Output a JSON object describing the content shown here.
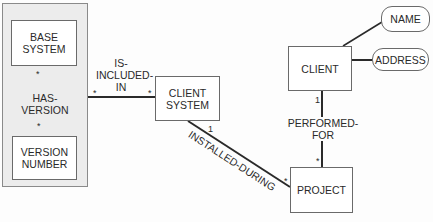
{
  "diagram": {
    "type": "entity-relationship / object model",
    "group": {
      "name": "base-system-group"
    },
    "entities": {
      "base_system": "BASE\nSYSTEM",
      "version_number": "VERSION\nNUMBER",
      "client_system": "CLIENT\nSYSTEM",
      "client": "CLIENT",
      "project": "PROJECT"
    },
    "attributes": {
      "name": "NAME",
      "address": "ADDRESS"
    },
    "relationships": {
      "has_version": {
        "label": "HAS-VERSION",
        "from": "BASE SYSTEM",
        "from_mult": "*",
        "to": "VERSION NUMBER",
        "to_mult": "*"
      },
      "is_included_in": {
        "label": "IS-\nINCLUDED-\nIN",
        "from": "BASE SYSTEM/VERSION NUMBER group",
        "from_mult": "*",
        "to": "CLIENT SYSTEM",
        "to_mult": "*"
      },
      "installed_during": {
        "label": "INSTALLED-DURING",
        "from": "CLIENT SYSTEM",
        "from_mult": "1",
        "to": "PROJECT",
        "to_mult": "*"
      },
      "performed_for": {
        "label": "PERFORMED-FOR",
        "from": "CLIENT",
        "from_mult": "1",
        "to": "PROJECT",
        "to_mult": "*"
      }
    },
    "colors": {
      "background": "#fdfdfd",
      "group_fill": "#ececec",
      "line": "#2a2a2a",
      "box_border": "#6a6a6a"
    }
  }
}
